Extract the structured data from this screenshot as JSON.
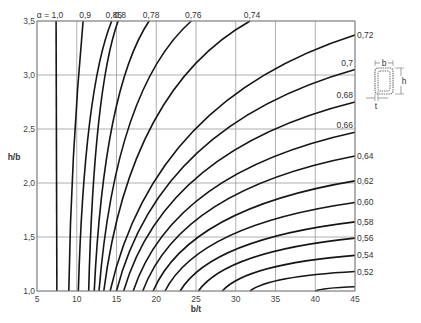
{
  "chart_data": {
    "type": "line",
    "title": "",
    "xlabel": "b/t",
    "ylabel": "h/b",
    "xlim": [
      5,
      45
    ],
    "ylim": [
      1.0,
      3.5
    ],
    "grid": true,
    "x_ticks": [
      "5",
      "10",
      "15",
      "20",
      "25",
      "30",
      "35",
      "40",
      "45"
    ],
    "y_ticks": [
      "1,0",
      "1,5",
      "2,0",
      "2,5",
      "3,0",
      "3,5"
    ],
    "series_parameter": "α",
    "alpha_prefix": "α = ",
    "series": [
      {
        "name": "1,0",
        "alpha": 1.0,
        "bottom_bt": 7.5,
        "end": "top",
        "end_value": 7.4,
        "label_pos": "top"
      },
      {
        "name": "0,9",
        "alpha": 0.9,
        "bottom_bt": 9.0,
        "end": "top",
        "end_value": 10.8,
        "label_pos": "top"
      },
      {
        "name": "0,85",
        "alpha": 0.85,
        "bottom_bt": 10.2,
        "end": "top",
        "end_value": 14.4,
        "label_pos": "top"
      },
      {
        "name": "0,8",
        "alpha": 0.8,
        "bottom_bt": 11.5,
        "end": "top",
        "end_value": 15.2,
        "label_pos": "top"
      },
      {
        "name": "0,78",
        "alpha": 0.78,
        "bottom_bt": 12.2,
        "end": "top",
        "end_value": 19.1,
        "label_pos": "top"
      },
      {
        "name": "0,76",
        "alpha": 0.76,
        "bottom_bt": 12.8,
        "end": "top",
        "end_value": 24.4,
        "label_pos": "top"
      },
      {
        "name": "0,74",
        "alpha": 0.74,
        "bottom_bt": 13.4,
        "end": "top",
        "end_value": 31.8,
        "label_pos": "top"
      },
      {
        "name": "0,72",
        "alpha": 0.72,
        "bottom_bt": 14.2,
        "end": "right",
        "end_value": 3.37,
        "label_pos": "right"
      },
      {
        "name": "0,7",
        "alpha": 0.7,
        "bottom_bt": 15.0,
        "end": "right",
        "end_value": 3.05,
        "label_pos": "right-inside"
      },
      {
        "name": "0,68",
        "alpha": 0.68,
        "bottom_bt": 15.9,
        "end": "right",
        "end_value": 2.75,
        "label_pos": "right-inside"
      },
      {
        "name": "0,66",
        "alpha": 0.66,
        "bottom_bt": 17.1,
        "end": "right",
        "end_value": 2.47,
        "label_pos": "right-inside"
      },
      {
        "name": "0,64",
        "alpha": 0.64,
        "bottom_bt": 18.3,
        "end": "right",
        "end_value": 2.25,
        "label_pos": "right"
      },
      {
        "name": "0,62",
        "alpha": 0.62,
        "bottom_bt": 19.6,
        "end": "right",
        "end_value": 2.02,
        "label_pos": "right"
      },
      {
        "name": "0,60",
        "alpha": 0.6,
        "bottom_bt": 21.1,
        "end": "right",
        "end_value": 1.82,
        "label_pos": "right"
      },
      {
        "name": "0,58",
        "alpha": 0.58,
        "bottom_bt": 23.0,
        "end": "right",
        "end_value": 1.64,
        "label_pos": "right"
      },
      {
        "name": "0,56",
        "alpha": 0.56,
        "bottom_bt": 25.3,
        "end": "right",
        "end_value": 1.49,
        "label_pos": "right"
      },
      {
        "name": "0,54",
        "alpha": 0.54,
        "bottom_bt": 28.3,
        "end": "right",
        "end_value": 1.33,
        "label_pos": "right"
      },
      {
        "name": "0,52",
        "alpha": 0.52,
        "bottom_bt": 31.8,
        "end": "right",
        "end_value": 1.18,
        "label_pos": "right"
      },
      {
        "name": "",
        "alpha": 0.5,
        "bottom_bt": 40.0,
        "end": "right",
        "end_value": 1.04,
        "label_pos": "none"
      }
    ],
    "inset_diagram": {
      "type": "rectangular-hollow-section",
      "labels": {
        "width": "b",
        "height": "h",
        "thickness": "t"
      }
    }
  }
}
